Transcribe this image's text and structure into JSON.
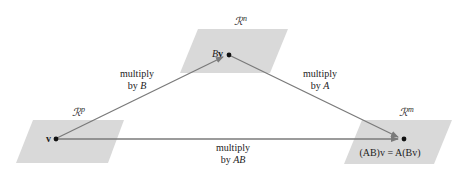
{
  "colors": {
    "plane_fill": "#d9d9d9",
    "arrow": "#7a7a7a",
    "dot": "#111111",
    "text": "#222222"
  },
  "spaces": {
    "domain": {
      "label": "ℛ",
      "sup": "p"
    },
    "middle": {
      "label": "ℛ",
      "sup": "n"
    },
    "codomain": {
      "label": "ℛ",
      "sup": "m"
    }
  },
  "points": {
    "v": {
      "label": "v"
    },
    "Bv": {
      "label_italic": "B",
      "label_bold": "v"
    },
    "result": {
      "label": "(AB)v = A(Bv)"
    }
  },
  "arrows": {
    "multiply_B": {
      "line1": "multiply",
      "line2_prefix": "by ",
      "line2_math": "B"
    },
    "multiply_A": {
      "line1": "multiply",
      "line2_prefix": "by ",
      "line2_math": "A"
    },
    "multiply_AB": {
      "line1": "multiply",
      "line2_prefix": "by ",
      "line2_math": "AB"
    }
  }
}
